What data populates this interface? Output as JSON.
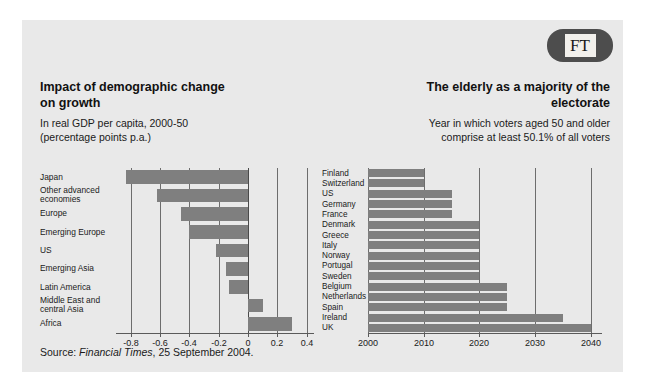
{
  "logo": {
    "text": "FT",
    "name": "ft-logo",
    "bg_color": "#4d4d4d",
    "box_color": "#f2f0ec"
  },
  "source": {
    "prefix": "Source: ",
    "publication": "Financial Times",
    "suffix": ", 25 September 2004."
  },
  "figure": {
    "background": "#e9e9e9",
    "bar_color": "#7f7f7f",
    "gridline_color": "#6d6d6d"
  },
  "chart_data": [
    {
      "type": "bar",
      "orientation": "horizontal",
      "id": "impact-of-demographic-change",
      "title": "Impact of demographic change on growth",
      "title_lines": [
        "Impact of demographic change",
        "on growth"
      ],
      "subtitle": "In real GDP per capita, 2000-50 (percentage points p.a.)",
      "subtitle_lines": [
        "In real GDP per capita, 2000-50",
        "(percentage points p.a.)"
      ],
      "xlabel": "",
      "ylabel": "",
      "xlim": [
        -0.9,
        0.45
      ],
      "xticks": [
        -0.8,
        -0.6,
        -0.4,
        -0.2,
        0,
        0.2,
        0.4
      ],
      "xtick_labels": [
        "-0.8",
        "-0.6",
        "-0.4",
        "-0.2",
        "0",
        "0.2",
        "0.4"
      ],
      "grid": true,
      "legend": "none",
      "categories": [
        "Japan",
        "Other advanced economies",
        "Europe",
        "Emerging Europe",
        "US",
        "Emerging Asia",
        "Latin America",
        "Middle East and central Asia",
        "Africa"
      ],
      "category_lines": [
        [
          "Japan"
        ],
        [
          "Other advanced",
          "economies"
        ],
        [
          "Europe"
        ],
        [
          "Emerging Europe"
        ],
        [
          "US"
        ],
        [
          "Emerging Asia"
        ],
        [
          "Latin America"
        ],
        [
          "Middle East and",
          "central Asia"
        ],
        [
          "Africa"
        ]
      ],
      "values": [
        -0.83,
        -0.62,
        -0.46,
        -0.4,
        -0.22,
        -0.15,
        -0.13,
        0.1,
        0.3
      ]
    },
    {
      "type": "bar",
      "orientation": "horizontal",
      "id": "elderly-majority-of-electorate",
      "title": "The elderly as a majority of the electorate",
      "title_lines": [
        "The elderly as a majority of the",
        "electorate"
      ],
      "subtitle": "Year in which voters aged 50 and older comprise at least 50.1% of all voters",
      "subtitle_lines": [
        "Year in which voters aged 50 and older",
        "comprise at least 50.1% of all voters"
      ],
      "xlabel": "",
      "ylabel": "",
      "xlim": [
        2000,
        2042
      ],
      "xticks": [
        2000,
        2010,
        2020,
        2030,
        2040
      ],
      "xtick_labels": [
        "2000",
        "2010",
        "2020",
        "2030",
        "2040"
      ],
      "grid": true,
      "legend": "none",
      "categories": [
        "Finland",
        "Switzerland",
        "US",
        "Germany",
        "France",
        "Denmark",
        "Greece",
        "Italy",
        "Norway",
        "Portugal",
        "Sweden",
        "Belgium",
        "Netherlands",
        "Spain",
        "Ireland",
        "UK"
      ],
      "values": [
        2010,
        2010,
        2015,
        2015,
        2015,
        2020,
        2020,
        2020,
        2020,
        2020,
        2020,
        2025,
        2025,
        2025,
        2035,
        2040
      ]
    }
  ]
}
